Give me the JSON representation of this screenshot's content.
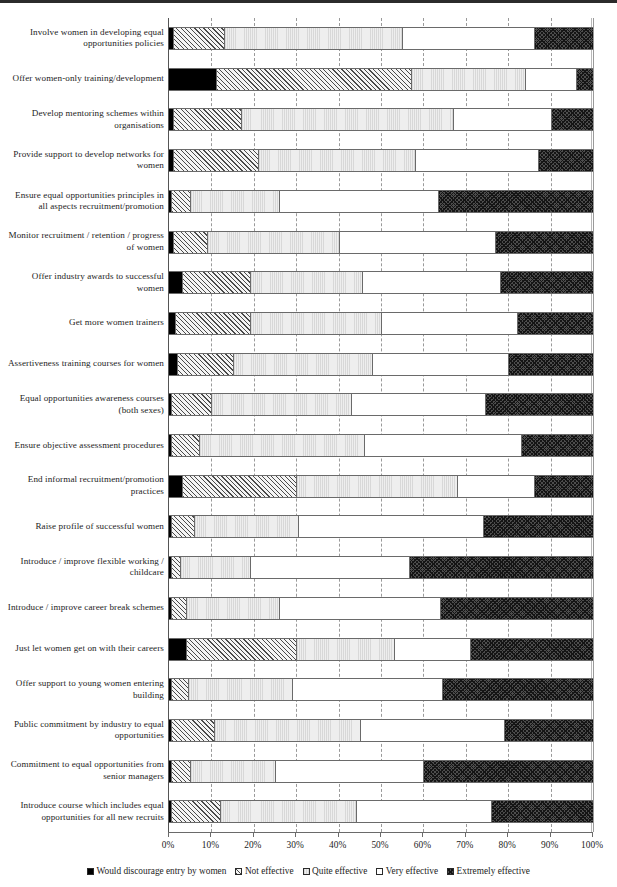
{
  "chart_data": {
    "type": "bar",
    "orientation": "horizontal",
    "stacked": true,
    "normalized": true,
    "title": "",
    "xlabel": "",
    "ylabel": "",
    "xlim": [
      0,
      100
    ],
    "grid": true,
    "legend_position": "bottom",
    "xticks": [
      "0%",
      "10%",
      "20%",
      "30%",
      "40%",
      "50%",
      "60%",
      "70%",
      "80%",
      "90%",
      "100%"
    ],
    "xtick_values": [
      0,
      10,
      20,
      30,
      40,
      50,
      60,
      70,
      80,
      90,
      100
    ],
    "series": [
      {
        "name": "Would discourage entry by women",
        "pattern": "solid-black",
        "values": [
          1,
          11,
          1,
          1,
          0.5,
          1,
          3,
          1.5,
          2,
          0.5,
          0.5,
          3,
          0.5,
          0.5,
          0.5,
          4,
          0.5,
          0.5,
          0.5,
          0.5
        ]
      },
      {
        "name": "Not effective",
        "pattern": "diagonal-hatch",
        "values": [
          12,
          46,
          16,
          20,
          4.5,
          8,
          16,
          17.5,
          13,
          9.5,
          6.5,
          27,
          5.5,
          2,
          3.5,
          26,
          4,
          10,
          4.5,
          11.5
        ]
      },
      {
        "name": "Quite effective",
        "pattern": "light-stipple",
        "values": [
          42,
          27,
          50,
          37,
          21,
          31,
          26.5,
          31,
          33,
          33,
          39,
          38,
          24.5,
          16.5,
          22,
          23,
          24.5,
          34.5,
          20,
          32
        ]
      },
      {
        "name": "Very effective",
        "pattern": "white",
        "values": [
          31,
          12,
          23,
          29,
          37.5,
          37,
          32.5,
          32,
          32,
          31.5,
          37,
          18,
          43.5,
          37.5,
          38,
          18,
          35.5,
          34,
          35,
          32
        ]
      },
      {
        "name": "Extremely effective",
        "pattern": "dense-cross-hatch",
        "values": [
          14,
          4,
          10,
          13,
          36.5,
          23,
          22,
          18,
          20,
          25.5,
          17,
          14,
          26,
          43.5,
          36,
          29,
          35.5,
          21,
          40,
          24
        ]
      }
    ],
    "categories": [
      "Involve women in developing equal opportunities policies",
      "Offer women-only training/development",
      "Develop mentoring schemes within organisations",
      "Provide support to develop networks for women",
      "Ensure equal opportunities principles in all aspects recruitment/promotion",
      "Monitor recruitment / retention / progress of women",
      "Offer industry awards to successful women",
      "Get more women trainers",
      "Assertiveness training courses for women",
      "Equal opportunities awareness courses (both sexes)",
      "Ensure objective assessment procedures",
      "End informal recruitment/promotion practices",
      "Raise profile of successful women",
      "Introduce / improve flexible working / childcare",
      "Introduce / improve career break schemes",
      "Just let women get on with their careers",
      "Offer support to young women entering building",
      "Public commitment by industry to equal opportunities",
      "Commitment to equal opportunities from senior managers",
      "Introduce course which includes equal opportunities for all new recruits"
    ]
  },
  "legend": {
    "items": [
      {
        "label": "Would discourage entry by women",
        "swatch": "solid-black-swatch"
      },
      {
        "label": "Not effective",
        "swatch": "hatch-swatch"
      },
      {
        "label": "Quite effective",
        "swatch": "light-swatch"
      },
      {
        "label": "Very effective",
        "swatch": "white-swatch"
      },
      {
        "label": "Extremely effective",
        "swatch": "cross-hatch-swatch"
      }
    ]
  }
}
